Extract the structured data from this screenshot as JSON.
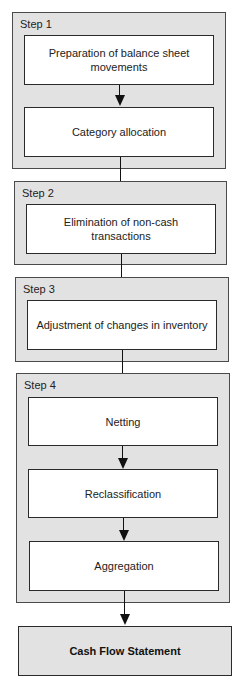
{
  "diagram": {
    "type": "flowchart",
    "steps": [
      {
        "label": "Step 1",
        "boxes": [
          {
            "text": "Preparation of balance sheet movements"
          },
          {
            "text": "Category allocation"
          }
        ]
      },
      {
        "label": "Step 2",
        "boxes": [
          {
            "text": "Elimination of non-cash transactions"
          }
        ]
      },
      {
        "label": "Step 3",
        "boxes": [
          {
            "text": "Adjustment of changes in inventory"
          }
        ]
      },
      {
        "label": "Step 4",
        "boxes": [
          {
            "text": "Netting"
          },
          {
            "text": "Reclassification"
          },
          {
            "text": "Aggregation"
          }
        ]
      }
    ],
    "output": {
      "text": "Cash Flow Statement"
    },
    "colors": {
      "step_fill": "#e2e2e2",
      "box_fill": "#ffffff",
      "border": "#2a2a2a",
      "arrow": "#111111"
    }
  }
}
